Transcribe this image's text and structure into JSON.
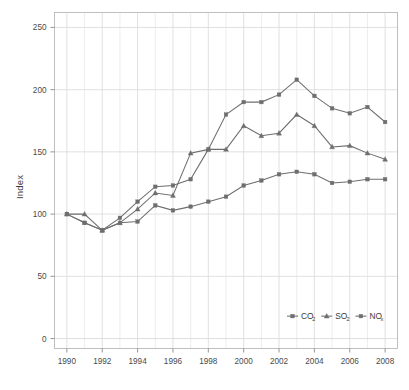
{
  "chart_data": {
    "type": "line",
    "title": "",
    "xlabel": "",
    "ylabel": "Index",
    "x": [
      1990,
      1991,
      1992,
      1993,
      1994,
      1995,
      1996,
      1997,
      1998,
      1999,
      2000,
      2001,
      2002,
      2003,
      2004,
      2005,
      2006,
      2007,
      2008
    ],
    "xlim": [
      1989.3,
      2008.7
    ],
    "ylim": [
      -8,
      262
    ],
    "xticks": [
      1990,
      1992,
      1994,
      1996,
      1998,
      2000,
      2002,
      2004,
      2006,
      2008
    ],
    "xticklabels": [
      "1990",
      "1992",
      "1994",
      "1996",
      "1998",
      "2000",
      "2002",
      "2004",
      "2006",
      "2008"
    ],
    "yticks": [
      0,
      50,
      100,
      150,
      200,
      250
    ],
    "yticklabels": [
      "0",
      "50",
      "100",
      "150",
      "200",
      "250"
    ],
    "grid": true,
    "legend_position": "bottom-right",
    "series": [
      {
        "name": "CO2",
        "label_main": "CO",
        "label_sub": "2",
        "marker": "square",
        "color": "#6e6e6e",
        "values": [
          100,
          93,
          87,
          97,
          110,
          122,
          123,
          128,
          152,
          180,
          190,
          190,
          196,
          208,
          195,
          185,
          181,
          186,
          174
        ]
      },
      {
        "name": "SO2",
        "label_main": "SO",
        "label_sub": "2",
        "marker": "triangle",
        "color": "#6e6e6e",
        "values": [
          100,
          100,
          87,
          93,
          104,
          117,
          115,
          149,
          152,
          152,
          171,
          163,
          165,
          180,
          171,
          154,
          155,
          149,
          144
        ]
      },
      {
        "name": "NOx",
        "label_main": "NO",
        "label_sub": "x",
        "marker": "square",
        "color": "#6e6e6e",
        "values": [
          100,
          93,
          87,
          93,
          94,
          107,
          103,
          106,
          110,
          114,
          123,
          127,
          132,
          134,
          132,
          125,
          126,
          128,
          128
        ]
      }
    ]
  },
  "colors": {
    "line": "#6e6e6e",
    "grid": "#e9e9e9",
    "grid_major": "#dcdcdc",
    "frame": "#b9b9b9",
    "text": "#3b3b3b",
    "background": "#ffffff"
  }
}
